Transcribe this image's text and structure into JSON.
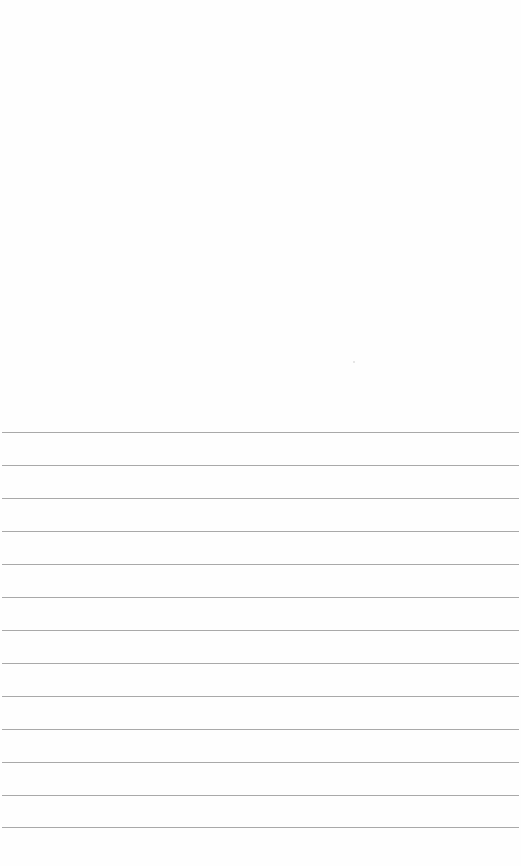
{
  "page": {
    "type": "lined-paper",
    "background_color": "#fefefe",
    "line_color": "#9a9a9a",
    "line_count": 13,
    "line_positions_y": [
      432,
      465,
      498,
      531,
      564,
      597,
      630,
      663,
      696,
      729,
      762,
      795,
      827
    ],
    "text": ""
  }
}
